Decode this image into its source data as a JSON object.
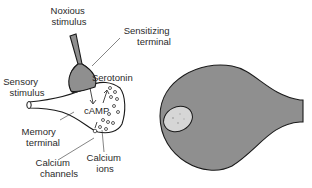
{
  "diagram": {
    "type": "neuron-synapse-illustration",
    "labels": {
      "noxious_stimulus": [
        "Noxious",
        "stimulus"
      ],
      "sensitizing_terminal": [
        "Sensitizing",
        "terminal"
      ],
      "serotonin": "Serotonin",
      "sensory_stimulus": [
        "Sensory",
        "stimulus"
      ],
      "camp": "cAMP",
      "memory_terminal": [
        "Memory",
        "terminal"
      ],
      "calcium_channels": [
        "Calcium",
        "channels"
      ],
      "calcium_ions": [
        "Calcium",
        "ions"
      ]
    },
    "colors": {
      "cell_fill": "#8f8f8f",
      "outline": "#1a1a1a",
      "nucleus_fill": "#d8d8d8",
      "background": "#ffffff"
    }
  }
}
